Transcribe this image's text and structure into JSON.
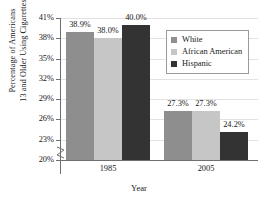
{
  "chart_data": {
    "type": "bar",
    "title": "",
    "xlabel": "Year",
    "ylabel_line1": "Percentage of Americans",
    "ylabel_line2": "13 and Older Using Cigarettes",
    "categories": [
      "1985",
      "2005"
    ],
    "series": [
      {
        "name": "White",
        "color": "#8e8e8e",
        "values": [
          38.9,
          27.3
        ],
        "labels": [
          "38.9%",
          "27.3%"
        ]
      },
      {
        "name": "African American",
        "color": "#c6c6c6",
        "values": [
          38.0,
          27.3
        ],
        "labels": [
          "38.0%",
          "27.3%"
        ]
      },
      {
        "name": "Hispanic",
        "color": "#333333",
        "values": [
          40.0,
          24.2
        ],
        "labels": [
          "40.0%",
          "24.2%"
        ]
      }
    ],
    "ylim": [
      20,
      41
    ],
    "yticks": [
      "20%",
      "23%",
      "26%",
      "29%",
      "32%",
      "35%",
      "38%",
      "41%"
    ],
    "ytick_values": [
      20,
      23,
      26,
      29,
      32,
      35,
      38,
      41
    ],
    "grid": true,
    "axis_break": true,
    "legend_position": "upper-right-inside"
  }
}
